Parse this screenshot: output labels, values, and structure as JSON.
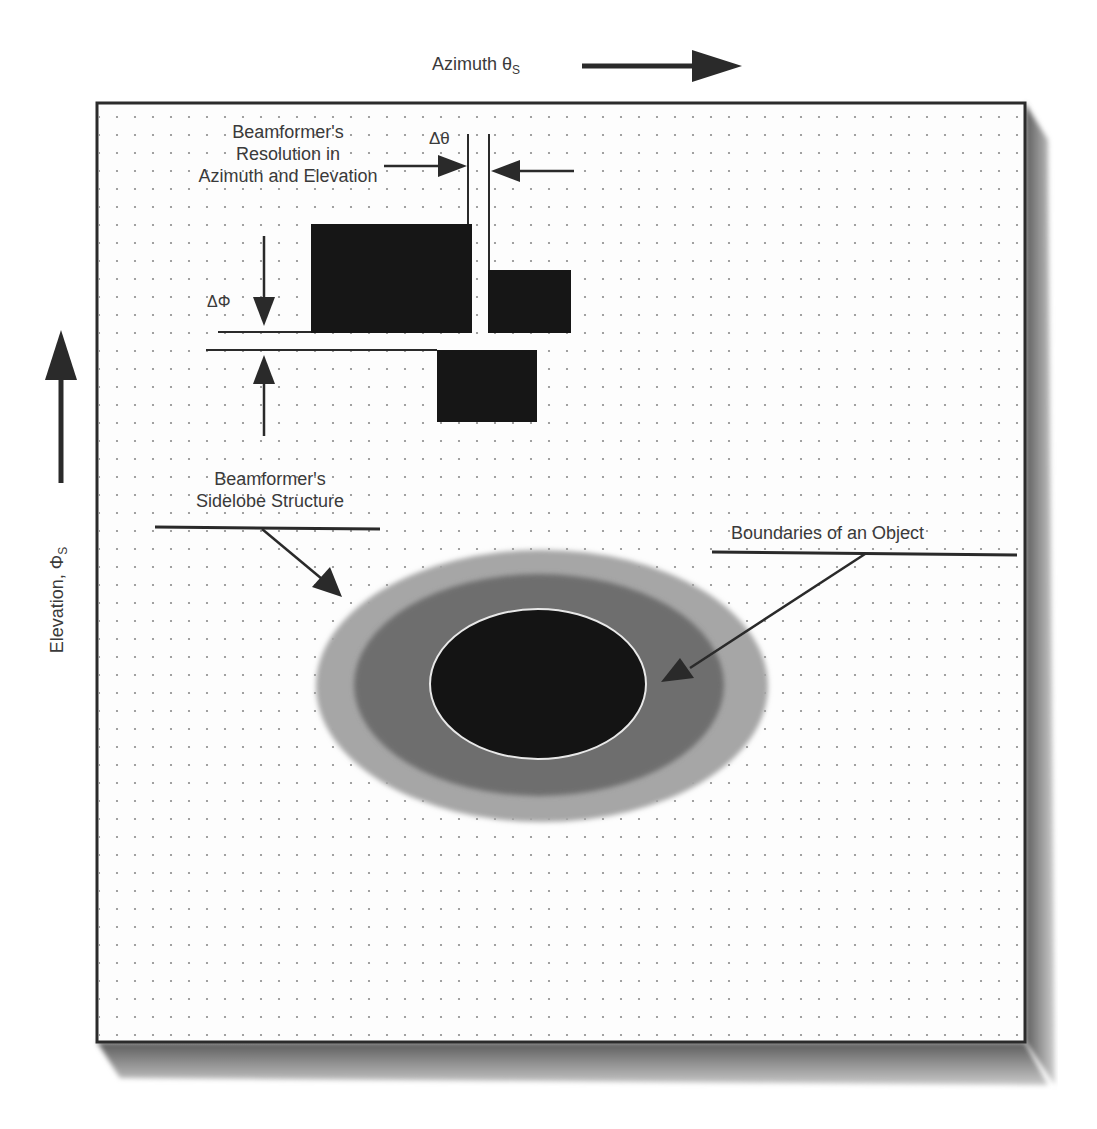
{
  "figure": {
    "colors": {
      "background": "#ffffff",
      "board": "#fdfdfd",
      "board_border": "#2b2b2b",
      "shadow": "#7a7a7a",
      "grid_dot": "#8a8a8a",
      "resolution_cell": "#161616",
      "sidelobe_outer": "#a6a6a6",
      "sidelobe_inner": "#6e6e6e",
      "object": "#141414",
      "object_edge": "#e8e8e8",
      "arrow": "#2a2a2a",
      "text": "#3a3a3a"
    }
  },
  "axes": {
    "azimuth": {
      "label": "Azimuth θ",
      "subscript": "S",
      "direction": "right"
    },
    "elevation": {
      "label": "Elevation, Φ",
      "subscript": "S",
      "direction": "up"
    }
  },
  "annotations": {
    "resolution": {
      "lines": [
        "Beamformer's",
        "Resolution in",
        "Azimuth and Elevation"
      ]
    },
    "delta_theta": "Δθ",
    "delta_phi": "ΔΦ",
    "sidelobe": {
      "lines": [
        "Beamformer's",
        "Sidelobe Structure"
      ]
    },
    "object_boundary": "Boundaries of an Object"
  }
}
